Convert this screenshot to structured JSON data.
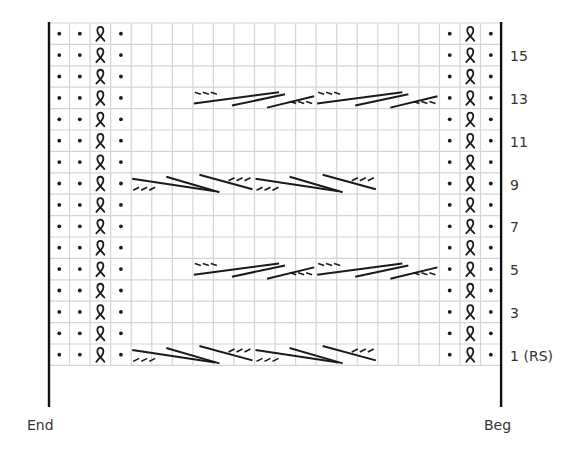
{
  "chart_title": "Knitting chart",
  "grid": {
    "columns": 22,
    "rows": 16,
    "x0": 49,
    "y0": 23,
    "cell_width": 20.55,
    "cell_height": 21.4,
    "grid_color": "#d4d4d4",
    "ink_color": "#1a1a1a"
  },
  "border_stitches": {
    "left": [
      "purl",
      "purl",
      "twisted-knit",
      "purl"
    ],
    "right": [
      "purl",
      "twisted-knit",
      "purl"
    ]
  },
  "cables": [
    {
      "row": 13,
      "type": "right-cross",
      "start_col": 7,
      "count": 2,
      "width": 6
    },
    {
      "row": 9,
      "type": "left-cross",
      "start_col": 4,
      "count": 2,
      "width": 6
    },
    {
      "row": 5,
      "type": "right-cross",
      "start_col": 7,
      "count": 2,
      "width": 6
    },
    {
      "row": 1,
      "type": "left-cross",
      "start_col": 4,
      "count": 2,
      "width": 6
    }
  ],
  "row_labels": [
    {
      "row": 15,
      "text": "15"
    },
    {
      "row": 13,
      "text": "13"
    },
    {
      "row": 11,
      "text": "11"
    },
    {
      "row": 9,
      "text": "9"
    },
    {
      "row": 7,
      "text": "7"
    },
    {
      "row": 5,
      "text": "5"
    },
    {
      "row": 3,
      "text": "3"
    },
    {
      "row": 1,
      "text": "1 (RS)"
    }
  ],
  "labels": {
    "end": "End",
    "beg": "Beg"
  }
}
